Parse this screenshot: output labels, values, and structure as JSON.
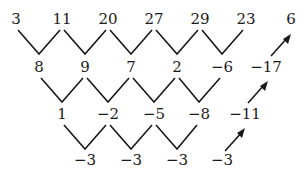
{
  "diagram": {
    "type": "difference-table",
    "rows": [
      {
        "level": 0,
        "values": [
          "3",
          "11",
          "20",
          "27",
          "29",
          "23",
          "6"
        ]
      },
      {
        "level": 1,
        "values": [
          "8",
          "9",
          "7",
          "2",
          "−6",
          "−17"
        ]
      },
      {
        "level": 2,
        "values": [
          "1",
          "−2",
          "−5",
          "−8",
          "−11"
        ]
      },
      {
        "level": 3,
        "values": [
          "−3",
          "−3",
          "−3",
          "−3"
        ]
      }
    ],
    "extrapolated_path": [
      "−3",
      "−11",
      "−17",
      "6"
    ],
    "arrow_color": "#1a1a1a",
    "line_color": "#1a1a1a"
  }
}
